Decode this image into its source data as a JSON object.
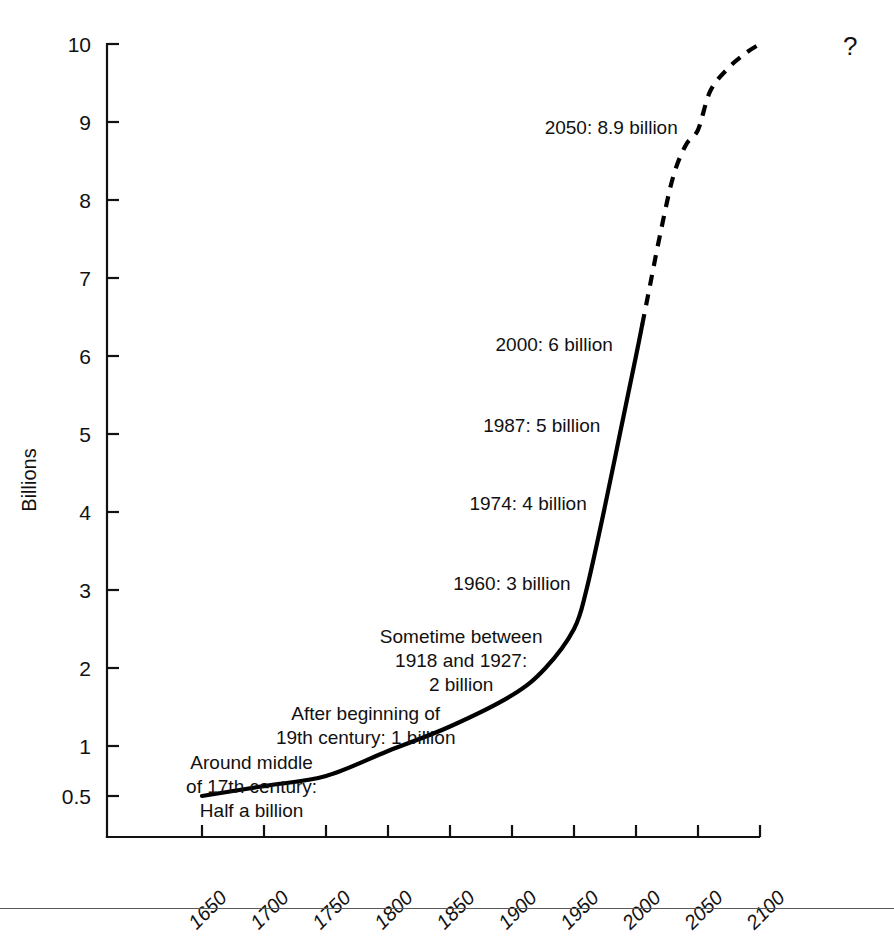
{
  "chart_data": {
    "type": "line",
    "title": "",
    "subtitle": "",
    "xlabel": "",
    "ylabel": "Billions",
    "xlim": [
      1625,
      2125
    ],
    "ylim": [
      0,
      10
    ],
    "grid": false,
    "legend_position": "none",
    "x_tick_labels": [
      "1650",
      "1700",
      "1750",
      "1800",
      "1850",
      "1900",
      "1950",
      "2000",
      "2050",
      "2100"
    ],
    "x_ticks": [
      1650,
      1700,
      1750,
      1800,
      1850,
      1900,
      1950,
      2000,
      2050,
      2100
    ],
    "y_tick_labels": [
      "10",
      "9",
      "8",
      "7",
      "6",
      "5",
      "4",
      "3",
      "2",
      "1",
      "0.5"
    ],
    "y_ticks": [
      10,
      9,
      8,
      7,
      6,
      5,
      4,
      3,
      2,
      1,
      0.5
    ],
    "series": [
      {
        "name": "World population (historical)",
        "style": "solid",
        "x": [
          1650,
          1700,
          1750,
          1800,
          1850,
          1900,
          1927,
          1950,
          1960,
          1974,
          1987,
          2000,
          2005
        ],
        "values": [
          0.5,
          0.6,
          0.7,
          0.95,
          1.25,
          1.65,
          2.0,
          2.5,
          3.0,
          4.0,
          5.0,
          6.0,
          6.4
        ]
      },
      {
        "name": "World population (projected)",
        "style": "dashed",
        "x": [
          2005,
          2010,
          2020,
          2030,
          2040,
          2050,
          2060,
          2075,
          2090,
          2100
        ],
        "values": [
          6.4,
          6.8,
          7.6,
          8.3,
          8.7,
          8.9,
          9.4,
          9.7,
          9.9,
          10.0
        ]
      }
    ],
    "annotations": [
      {
        "id": "annotation-2050",
        "lines": [
          "2050: 8.9 billion"
        ],
        "x": 1980,
        "y": 8.85
      },
      {
        "id": "annotation-2000",
        "lines": [
          "2000: 6 billion"
        ],
        "x": 1934,
        "y": 6.07
      },
      {
        "id": "annotation-1987",
        "lines": [
          "1987: 5 billion"
        ],
        "x": 1924,
        "y": 5.03
      },
      {
        "id": "annotation-1974",
        "lines": [
          "1974: 4 billion"
        ],
        "x": 1913,
        "y": 4.02
      },
      {
        "id": "annotation-1960",
        "lines": [
          "1960: 3 billion"
        ],
        "x": 1900,
        "y": 3.0
      },
      {
        "id": "annotation-2-billion",
        "lines": [
          "Sometime between",
          "1918 and 1927:",
          "2 billion"
        ],
        "x": 1859,
        "y": 2.32
      },
      {
        "id": "annotation-1-billion",
        "lines": [
          "After beginning of",
          "19th century: 1 billion"
        ],
        "x": 1782,
        "y": 1.33
      },
      {
        "id": "annotation-half-billion",
        "lines": [
          "Around middle",
          "of 17th century:",
          "Half a billion"
        ],
        "x": 1690,
        "y": 0.77
      }
    ],
    "end_marker": "?"
  }
}
